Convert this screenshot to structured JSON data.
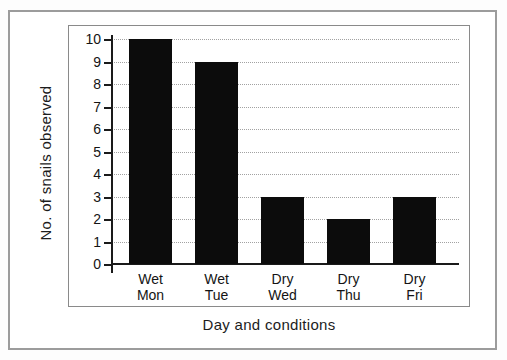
{
  "figure": {
    "background": "#ffffff",
    "frame_color": "#9c9c9c",
    "plot_border_color": "#8a8a8a"
  },
  "chart_data": {
    "type": "bar",
    "xlabel": "Day and conditions",
    "ylabel": "No. of snails observed",
    "categories": [
      "Wet\nMon",
      "Wet\nTue",
      "Dry\nWed",
      "Dry\nThu",
      "Dry\nFri"
    ],
    "values": [
      10,
      9,
      3,
      2,
      3
    ],
    "yticks": [
      0,
      1,
      2,
      3,
      4,
      5,
      6,
      7,
      8,
      9,
      10
    ],
    "ylim": [
      0,
      10
    ],
    "grid": true,
    "gridline_style": "dotted",
    "gridline_color": "#a2a2a2",
    "bar_color": "#0c0c0c",
    "axis_color": "#1a1a1a",
    "legend": "none"
  }
}
